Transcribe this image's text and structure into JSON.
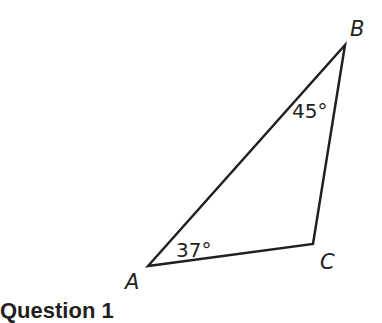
{
  "diagram": {
    "type": "triangle",
    "vertices": [
      {
        "name": "A",
        "x": 148,
        "y": 266,
        "label_x": 125,
        "label_y": 289
      },
      {
        "name": "B",
        "x": 345,
        "y": 45,
        "label_x": 350,
        "label_y": 36
      },
      {
        "name": "C",
        "x": 313,
        "y": 244,
        "label_x": 320,
        "label_y": 269
      }
    ],
    "angles": [
      {
        "vertex": "A",
        "label": "37°",
        "x": 176,
        "y": 257
      },
      {
        "vertex": "B",
        "label": "45°",
        "x": 292,
        "y": 118
      }
    ],
    "labels": {
      "A": "A",
      "B": "B",
      "C": "C"
    },
    "stroke_color": "#231f20"
  },
  "footer": {
    "heading": "Question 1"
  }
}
